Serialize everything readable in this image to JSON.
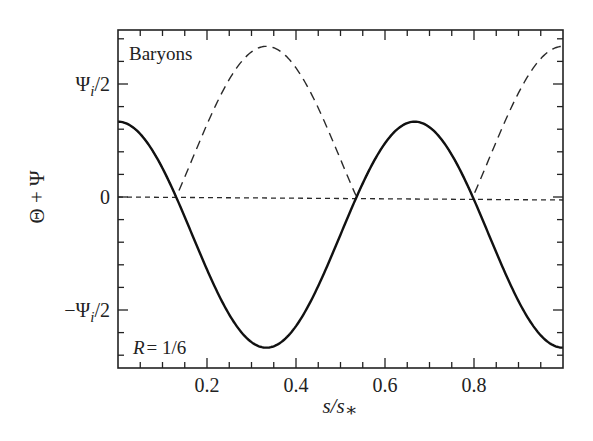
{
  "chart_data": {
    "type": "line",
    "title": "",
    "panel_label": "Baryons",
    "annotation": "R = 1/6",
    "xlabel": "s/s*",
    "ylabel": "Θ + Ψ",
    "xlim": [
      0,
      1
    ],
    "ylim_in_units_of_Psi_i": [
      -0.8,
      0.8
    ],
    "x_ticks": [
      {
        "value": 0.2,
        "label": "0.2"
      },
      {
        "value": 0.4,
        "label": "0.4"
      },
      {
        "value": 0.6,
        "label": "0.6"
      },
      {
        "value": 0.8,
        "label": "0.8"
      }
    ],
    "x_minor_step": 0.05,
    "y_ticks": [
      {
        "value": 0.5,
        "label": "Ψ_i/2",
        "main": "Ψ",
        "sub": "i",
        "suffix": "/2",
        "prefix": ""
      },
      {
        "value": 0,
        "label": "0",
        "main": "0",
        "sub": "",
        "suffix": "",
        "prefix": ""
      },
      {
        "value": -0.5,
        "label": "−Ψ_i/2",
        "main": "Ψ",
        "sub": "i",
        "suffix": "/2",
        "prefix": "−"
      }
    ],
    "y_minor_step": 0.1,
    "grid": false,
    "legend": null,
    "series": [
      {
        "name": "Θ + Ψ (solid)",
        "style": "solid",
        "formula": "0.5*cos(3*pi*x) - 1/6",
        "x": [
          0,
          0.05,
          0.1,
          0.1306,
          0.15,
          0.2,
          0.25,
          0.3,
          0.3333,
          0.35,
          0.4,
          0.45,
          0.5,
          0.536,
          0.55,
          0.6,
          0.65,
          0.6667,
          0.7,
          0.75,
          0.797,
          0.8,
          0.85,
          0.9,
          0.95,
          1.0
        ],
        "values": [
          0.333,
          0.279,
          0.127,
          0.0,
          -0.087,
          -0.321,
          -0.52,
          -0.642,
          -0.667,
          -0.66,
          -0.571,
          -0.396,
          -0.167,
          0.0,
          0.06,
          0.238,
          0.326,
          0.333,
          0.321,
          0.187,
          0.0,
          -0.012,
          -0.243,
          -0.463,
          -0.612,
          -0.667
        ]
      },
      {
        "name": "|Θ + Ψ| (dashed)",
        "style": "dashed",
        "x": [
          0,
          0.05,
          0.1,
          0.1306,
          0.15,
          0.2,
          0.25,
          0.3,
          0.3333,
          0.35,
          0.4,
          0.45,
          0.5,
          0.536,
          0.55,
          0.6,
          0.65,
          0.6667,
          0.7,
          0.75,
          0.797,
          0.8,
          0.85,
          0.9,
          0.95,
          1.0
        ],
        "values": [
          0.333,
          0.279,
          0.127,
          0.0,
          0.087,
          0.321,
          0.52,
          0.642,
          0.667,
          0.66,
          0.571,
          0.396,
          0.167,
          0.0,
          0.06,
          0.238,
          0.326,
          0.333,
          0.321,
          0.187,
          0.0,
          0.012,
          0.243,
          0.463,
          0.612,
          0.667
        ]
      },
      {
        "name": "zero line (short dashed)",
        "style": "dotted",
        "x": [
          0,
          1
        ],
        "values": [
          0,
          0
        ]
      }
    ]
  },
  "plot_area": {
    "left": 118,
    "right": 563,
    "top": 30,
    "bottom": 368,
    "y_zero": 197,
    "px_per_half_psi": 113
  },
  "colors": {
    "line": "#1a1a1a",
    "axis": "#222222",
    "background": "#ffffff"
  }
}
